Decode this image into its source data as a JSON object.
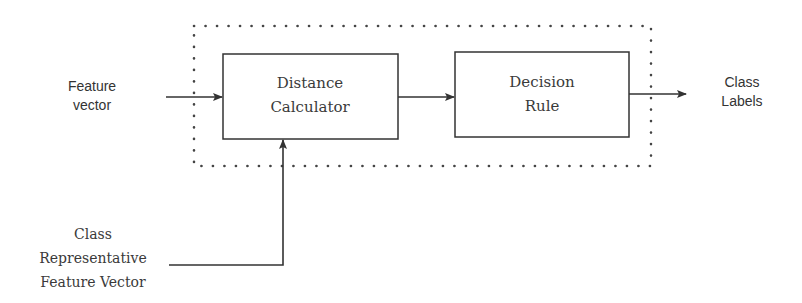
{
  "diagram": {
    "type": "block-diagram",
    "inputs": {
      "feature_vector": {
        "line1": "Feature",
        "line2": "vector"
      },
      "class_representative": {
        "line1": "Class",
        "line2": "Representative",
        "line3": "Feature Vector"
      }
    },
    "blocks": {
      "distance_calculator": {
        "line1": "Distance",
        "line2": "Calculator"
      },
      "decision_rule": {
        "line1": "Decision",
        "line2": "Rule"
      }
    },
    "output": {
      "line1": "Class",
      "line2": "Labels"
    },
    "container": {
      "style": "dotted"
    },
    "edges": [
      {
        "from": "Feature vector",
        "to": "Distance Calculator"
      },
      {
        "from": "Class Representative Feature Vector",
        "to": "Distance Calculator"
      },
      {
        "from": "Distance Calculator",
        "to": "Decision Rule"
      },
      {
        "from": "Decision Rule",
        "to": "Class Labels"
      }
    ],
    "colors": {
      "stroke": "#333333",
      "text": "#333333",
      "background": "#ffffff"
    }
  }
}
